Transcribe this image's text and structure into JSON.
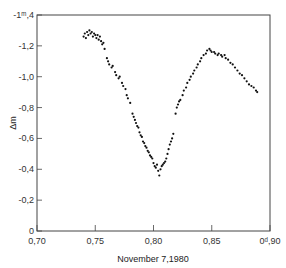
{
  "chart_data": {
    "type": "scatter",
    "title": "",
    "xlabel": "November 7,1980",
    "ylabel": "Δm",
    "xlim": [
      0.7,
      0.9
    ],
    "ylim": [
      0,
      -1.4
    ],
    "y_inverted": true,
    "grid": false,
    "legend": null,
    "x_ticks": [
      "0,70",
      "0,75",
      "0,80",
      "0,85",
      "0ᵈ,90"
    ],
    "x_tick_values": [
      0.7,
      0.75,
      0.8,
      0.85,
      0.9
    ],
    "y_ticks": [
      "0",
      "-0,2",
      "-0,4",
      "-0,6",
      "-0,8",
      "-1,0",
      "-1,2",
      "-1ᵐ,4"
    ],
    "y_tick_values": [
      0,
      -0.2,
      -0.4,
      -0.6,
      -0.8,
      -1.0,
      -1.2,
      -1.4
    ],
    "x_unit_mark": "d",
    "y_unit_mark": "m",
    "series": [
      {
        "name": "Δm",
        "points": [
          [
            0.74,
            -1.26
          ],
          [
            0.741,
            -1.28
          ],
          [
            0.742,
            -1.25
          ],
          [
            0.743,
            -1.29
          ],
          [
            0.744,
            -1.27
          ],
          [
            0.745,
            -1.3
          ],
          [
            0.746,
            -1.28
          ],
          [
            0.747,
            -1.29
          ],
          [
            0.748,
            -1.26
          ],
          [
            0.749,
            -1.28
          ],
          [
            0.75,
            -1.27
          ],
          [
            0.751,
            -1.25
          ],
          [
            0.752,
            -1.27
          ],
          [
            0.753,
            -1.24
          ],
          [
            0.754,
            -1.26
          ],
          [
            0.755,
            -1.23
          ],
          [
            0.756,
            -1.21
          ],
          [
            0.757,
            -1.22
          ],
          [
            0.758,
            -1.18
          ],
          [
            0.76,
            -1.12
          ],
          [
            0.761,
            -1.1
          ],
          [
            0.762,
            -1.08
          ],
          [
            0.764,
            -1.06
          ],
          [
            0.765,
            -1.07
          ],
          [
            0.767,
            -1.03
          ],
          [
            0.768,
            -1.01
          ],
          [
            0.77,
            -0.99
          ],
          [
            0.771,
            -1.0
          ],
          [
            0.773,
            -0.96
          ],
          [
            0.774,
            -0.94
          ],
          [
            0.776,
            -0.92
          ],
          [
            0.777,
            -0.88
          ],
          [
            0.778,
            -0.86
          ],
          [
            0.78,
            -0.83
          ],
          [
            0.782,
            -0.76
          ],
          [
            0.783,
            -0.74
          ],
          [
            0.784,
            -0.72
          ],
          [
            0.785,
            -0.7
          ],
          [
            0.786,
            -0.68
          ],
          [
            0.787,
            -0.67
          ],
          [
            0.788,
            -0.64
          ],
          [
            0.789,
            -0.62
          ],
          [
            0.79,
            -0.61
          ],
          [
            0.791,
            -0.58
          ],
          [
            0.792,
            -0.57
          ],
          [
            0.793,
            -0.55
          ],
          [
            0.794,
            -0.54
          ],
          [
            0.795,
            -0.52
          ],
          [
            0.796,
            -0.51
          ],
          [
            0.797,
            -0.49
          ],
          [
            0.798,
            -0.48
          ],
          [
            0.799,
            -0.47
          ],
          [
            0.8,
            -0.44
          ],
          [
            0.801,
            -0.42
          ],
          [
            0.802,
            -0.41
          ],
          [
            0.803,
            -0.43
          ],
          [
            0.804,
            -0.39
          ],
          [
            0.805,
            -0.36
          ],
          [
            0.806,
            -0.4
          ],
          [
            0.807,
            -0.42
          ],
          [
            0.808,
            -0.43
          ],
          [
            0.809,
            -0.44
          ],
          [
            0.81,
            -0.45
          ],
          [
            0.811,
            -0.47
          ],
          [
            0.812,
            -0.5
          ],
          [
            0.813,
            -0.53
          ],
          [
            0.814,
            -0.56
          ],
          [
            0.815,
            -0.58
          ],
          [
            0.816,
            -0.6
          ],
          [
            0.817,
            -0.63
          ],
          [
            0.819,
            -0.76
          ],
          [
            0.82,
            -0.8
          ],
          [
            0.821,
            -0.82
          ],
          [
            0.822,
            -0.84
          ],
          [
            0.823,
            -0.85
          ],
          [
            0.825,
            -0.88
          ],
          [
            0.826,
            -0.91
          ],
          [
            0.828,
            -0.93
          ],
          [
            0.829,
            -0.96
          ],
          [
            0.831,
            -0.98
          ],
          [
            0.832,
            -1.0
          ],
          [
            0.834,
            -1.02
          ],
          [
            0.835,
            -1.04
          ],
          [
            0.837,
            -1.06
          ],
          [
            0.838,
            -1.08
          ],
          [
            0.84,
            -1.1
          ],
          [
            0.841,
            -1.12
          ],
          [
            0.843,
            -1.14
          ],
          [
            0.845,
            -1.15
          ],
          [
            0.846,
            -1.17
          ],
          [
            0.848,
            -1.18
          ],
          [
            0.849,
            -1.17
          ],
          [
            0.85,
            -1.16
          ],
          [
            0.852,
            -1.16
          ],
          [
            0.853,
            -1.15
          ],
          [
            0.855,
            -1.14
          ],
          [
            0.856,
            -1.15
          ],
          [
            0.858,
            -1.14
          ],
          [
            0.859,
            -1.13
          ],
          [
            0.861,
            -1.14
          ],
          [
            0.862,
            -1.12
          ],
          [
            0.864,
            -1.11
          ],
          [
            0.866,
            -1.09
          ],
          [
            0.868,
            -1.08
          ],
          [
            0.87,
            -1.06
          ],
          [
            0.872,
            -1.04
          ],
          [
            0.874,
            -1.02
          ],
          [
            0.876,
            -1.01
          ],
          [
            0.878,
            -0.99
          ],
          [
            0.88,
            -0.97
          ],
          [
            0.882,
            -0.95
          ],
          [
            0.884,
            -0.94
          ],
          [
            0.886,
            -0.93
          ],
          [
            0.888,
            -0.91
          ],
          [
            0.889,
            -0.9
          ]
        ]
      }
    ]
  }
}
